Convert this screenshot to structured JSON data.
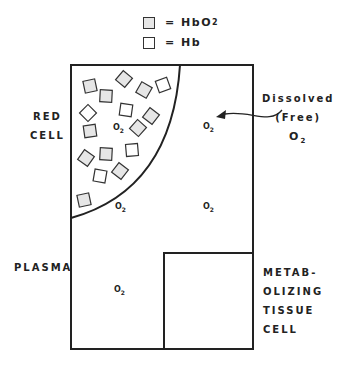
{
  "legend": {
    "items": [
      {
        "symbol": "shaded-square",
        "fill": "#e6e6e6",
        "text": "= HbO",
        "sub": "2"
      },
      {
        "symbol": "open-square",
        "fill": "#ffffff",
        "text": "= Hb",
        "sub": ""
      }
    ]
  },
  "labels": {
    "red_cell": [
      "RED",
      "CELL"
    ],
    "plasma": "PLASMA",
    "tissue": [
      "METAB-",
      "OLIZING",
      "TISSUE",
      "CELL"
    ],
    "dissolved": [
      "Dissolved",
      "(Free)"
    ],
    "dissolved_o2": "O",
    "dissolved_o2_sub": "2"
  },
  "o2_markers": [
    {
      "region": "red-cell",
      "text": "O",
      "sub": "2"
    },
    {
      "region": "plasma-near-cell",
      "text": "O",
      "sub": "2"
    },
    {
      "region": "plasma-upper-right",
      "text": "O",
      "sub": "2"
    },
    {
      "region": "plasma-mid-right",
      "text": "O",
      "sub": "2"
    },
    {
      "region": "plasma-lower-left",
      "text": "O",
      "sub": "2"
    }
  ],
  "colors": {
    "line": "#222222",
    "hbo2_fill": "#e6e6e6",
    "hb_fill": "#ffffff"
  }
}
